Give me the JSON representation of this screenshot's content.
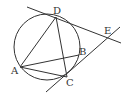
{
  "diagram": {
    "type": "geometry",
    "circle": {
      "cx": 47,
      "cy": 47,
      "r": 33
    },
    "points": {
      "A": {
        "label": "A",
        "x": 20,
        "y": 67,
        "lx": 11,
        "ly": 74
      },
      "B": {
        "label": "B",
        "x": 79,
        "y": 55,
        "lx": 79,
        "ly": 55
      },
      "C": {
        "label": "C",
        "x": 67,
        "y": 77,
        "lx": 66,
        "ly": 86
      },
      "D": {
        "label": "D",
        "x": 56,
        "y": 17,
        "lx": 53,
        "ly": 14
      },
      "E": {
        "label": "E",
        "x": 109,
        "y": 38,
        "lx": 104,
        "ly": 34
      }
    },
    "lines": [
      {
        "name": "tangent-line-DE",
        "x1": 27,
        "y1": 7,
        "x2": 121,
        "y2": 43
      },
      {
        "name": "secant-line-CBE",
        "x1": 46,
        "y1": 92,
        "x2": 120,
        "y2": 27
      },
      {
        "name": "segment-AD",
        "x1": 20,
        "y1": 67,
        "x2": 56,
        "y2": 17
      },
      {
        "name": "segment-DC",
        "x1": 56,
        "y1": 17,
        "x2": 67,
        "y2": 77
      },
      {
        "name": "segment-AB",
        "x1": 20,
        "y1": 67,
        "x2": 79,
        "y2": 55
      },
      {
        "name": "segment-AC",
        "x1": 20,
        "y1": 67,
        "x2": 67,
        "y2": 77
      }
    ],
    "colors": {
      "stroke": "#333333",
      "background": "#ffffff"
    }
  }
}
